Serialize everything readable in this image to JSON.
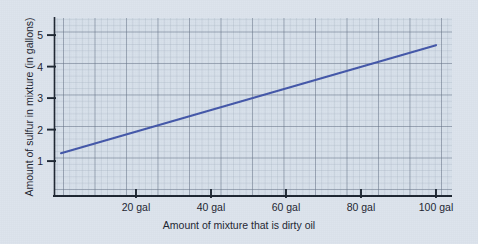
{
  "chart_data": {
    "type": "line",
    "title": "",
    "xlabel": "Amount of mixture that is dirty oil",
    "ylabel": "Amount of sulfur in mixture (in gallons)",
    "xlim": [
      0,
      106
    ],
    "ylim": [
      0,
      5.65
    ],
    "grid": true,
    "grid_minor_step_x": 1.68,
    "grid_minor_step_y": 0.2,
    "grid_major_step_x": 8.4,
    "grid_major_step_y": 1.0,
    "legend": "none",
    "x_ticks": [
      20,
      40,
      60,
      80,
      100
    ],
    "x_tick_labels": [
      "20 gal",
      "40 gal",
      "60 gal",
      "80 gal",
      "100 gal"
    ],
    "y_ticks": [
      1,
      2,
      3,
      4,
      5
    ],
    "y_tick_labels": [
      "1",
      "2",
      "3",
      "4",
      "5"
    ],
    "series": [
      {
        "name": "sulfur in mixture",
        "color": "#4256a8",
        "line_width": 2.1,
        "x": [
          0,
          10,
          20,
          30,
          40,
          50,
          60,
          70,
          80,
          90,
          100
        ],
        "values": [
          1.25,
          1.59,
          1.94,
          2.28,
          2.62,
          2.96,
          3.31,
          3.65,
          3.99,
          4.34,
          4.68
        ],
        "endpoints": {
          "start": {
            "x": 0,
            "y": 1.25
          },
          "end": {
            "x": 100,
            "y": 4.68
          }
        },
        "slope": 0.0343,
        "intercept": 1.25
      }
    ],
    "colors": {
      "background": "#dce3ec",
      "plot_background": "#d6dfe9",
      "grid_minor": "#aab6c6",
      "grid_major": "#5d6b7e",
      "axis": "#1b2430",
      "line": "#4256a8",
      "text": "#1b2430"
    }
  }
}
